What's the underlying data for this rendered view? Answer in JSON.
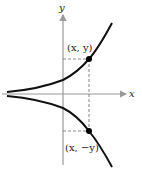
{
  "diagram": {
    "axes": {
      "x_label": "x",
      "y_label": "y"
    },
    "points": [
      {
        "label": "(x, y)",
        "px": [
          89,
          59
        ]
      },
      {
        "label": "(x, −y)",
        "px": [
          89,
          131
        ]
      }
    ],
    "colors": {
      "curve": "#111111",
      "axis": "#9a9a9a",
      "dashed": "#777777",
      "point": "#000000"
    }
  }
}
